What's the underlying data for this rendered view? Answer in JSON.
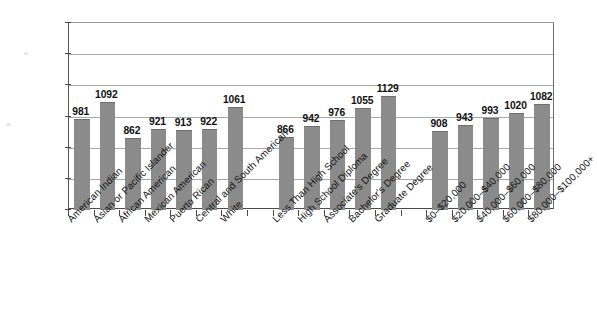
{
  "chart_data": {
    "type": "bar",
    "title": "",
    "subtitle": "",
    "xlabel": "",
    "ylabel": "",
    "ylim": [
      400,
      1600
    ],
    "ytick_values": [
      400,
      600,
      800,
      1000,
      1200,
      1400,
      1600
    ],
    "ytick_labels": [
      "400",
      "600",
      "800",
      "1000",
      "1200",
      "1400",
      "1600"
    ],
    "grid": true,
    "legend": "none",
    "bar_color": "#8b8b8b",
    "gridline_color": "#a8a8aa",
    "axis_color": "#4a4a4c",
    "groups": [
      {
        "name": "Race/Ethnicity",
        "categories": [
          "American Indian",
          "Asian or Pacific Islander",
          "African American",
          "Mexican American",
          "Puerto Rican",
          "Central and South American",
          "White"
        ],
        "values": [
          981,
          1092,
          862,
          921,
          913,
          922,
          1061
        ]
      },
      {
        "name": "Parental Education",
        "categories": [
          "Less Than High School",
          "High School Diploma",
          "Associate's Degree",
          "Bachelor's Degree",
          "Graduate Degree"
        ],
        "values": [
          866,
          942,
          976,
          1055,
          1129
        ]
      },
      {
        "name": "Family Income",
        "categories": [
          "$0–$20,000",
          "$20,000–$40,000",
          "$40,000–$60,000",
          "$60,000–$80,000",
          "$80,000–$100,000+"
        ],
        "values": [
          908,
          943,
          993,
          1020,
          1082
        ]
      }
    ],
    "categories": [
      "American Indian",
      "Asian or Pacific Islander",
      "African American",
      "Mexican American",
      "Puerto Rican",
      "Central and South American",
      "White",
      "Less Than High School",
      "High School Diploma",
      "Associate's Degree",
      "Bachelor's Degree",
      "Graduate Degree",
      "$0–$20,000",
      "$20,000–$40,000",
      "$40,000–$60,000",
      "$60,000–$80,000",
      "$80,000–$100,000+"
    ],
    "values": [
      981,
      1092,
      862,
      921,
      913,
      922,
      1061,
      866,
      942,
      976,
      1055,
      1129,
      908,
      943,
      993,
      1020,
      1082
    ]
  }
}
